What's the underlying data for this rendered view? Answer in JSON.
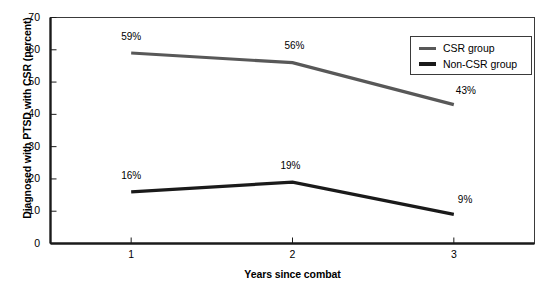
{
  "chart_data": {
    "type": "line",
    "title": "",
    "xlabel": "Years since combat",
    "ylabel": "Diagnosed with PTSD with CSR (percent)",
    "categories": [
      "1",
      "2",
      "3"
    ],
    "x": [
      1,
      2,
      3
    ],
    "xlim": [
      0.5,
      3.5
    ],
    "ylim": [
      0,
      70
    ],
    "yticks": [
      "0",
      "10",
      "20",
      "30",
      "40",
      "50",
      "60",
      "70"
    ],
    "ytick_values": [
      0,
      10,
      20,
      30,
      40,
      50,
      60,
      70
    ],
    "grid": false,
    "legend_position": "top-right",
    "series": [
      {
        "name": "CSR group",
        "values": [
          59,
          56,
          43
        ],
        "labels": [
          "59%",
          "56%",
          "43%"
        ],
        "color": "#585858"
      },
      {
        "name": "Non-CSR group",
        "values": [
          16,
          19,
          9
        ],
        "labels": [
          "16%",
          "19%",
          "9%"
        ],
        "color": "#1a1a1a"
      }
    ]
  },
  "legend": {
    "items": [
      {
        "label": "CSR group",
        "color": "#585858"
      },
      {
        "label": "Non-CSR group",
        "color": "#1a1a1a"
      }
    ]
  },
  "axis_color": "#1a1a1a",
  "frame_color": "#3a3a3a"
}
